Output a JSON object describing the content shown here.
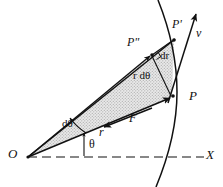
{
  "figure": {
    "background_color": "#ffffff",
    "line_color": "#111111",
    "shade_color": "#d8d8d8"
  },
  "points": {
    "origin": {
      "label": "O",
      "x": 28,
      "y": 157
    },
    "p": {
      "label": "P",
      "x": 172,
      "y": 97
    },
    "p_prime": {
      "label": "P'",
      "x": 174,
      "y": 40
    },
    "p_double_prime": {
      "label": "P\"",
      "x": 152,
      "y": 55
    }
  },
  "labels": {
    "origin": "O",
    "x_axis": "X",
    "point_p": "P",
    "point_p_prime": "P'",
    "point_p_double_prime": "P\"",
    "velocity": "v",
    "force": "F",
    "radius": "r",
    "d_r": "dr",
    "r_d_theta": "r dθ",
    "d_theta": "dθ",
    "theta": "θ"
  },
  "elements": {
    "x_axis_style": "dashed",
    "sector_fill": "stippled-gray",
    "arrows": [
      "velocity-at-p",
      "force-toward-origin",
      "radius-to-p",
      "radius-to-p-double-prime",
      "d-theta-arc",
      "theta-indicator"
    ]
  }
}
